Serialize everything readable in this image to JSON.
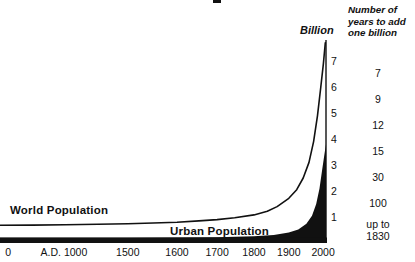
{
  "figure": {
    "background": "#ffffff",
    "ink_color": "#111111",
    "right_header_lines": [
      "Number of",
      "years to add",
      "one billion"
    ]
  },
  "chart_data": {
    "type": "area",
    "title": "",
    "y_axis_title": "Billion",
    "ylim": [
      0,
      7.8
    ],
    "y_tick_labels": [
      "1",
      "2",
      "3",
      "4",
      "5",
      "6",
      "7"
    ],
    "x_tick_labels": [
      "0",
      "A.D. 1000",
      "1500",
      "1600",
      "1700",
      "1800",
      "1900",
      "2000"
    ],
    "x_tick_positions": [
      0.025,
      0.196,
      0.392,
      0.543,
      0.666,
      0.779,
      0.886,
      0.991
    ],
    "x_axis_note": "non-linear year scale",
    "legend_position": "labels on chart",
    "grid": false,
    "series": [
      {
        "name": "World Population",
        "type": "line",
        "unit": "billions",
        "points": [
          [
            0.0,
            0.68
          ],
          [
            0.1,
            0.69
          ],
          [
            0.2,
            0.7
          ],
          [
            0.3,
            0.72
          ],
          [
            0.392,
            0.74
          ],
          [
            0.47,
            0.77
          ],
          [
            0.543,
            0.8
          ],
          [
            0.61,
            0.85
          ],
          [
            0.666,
            0.9
          ],
          [
            0.72,
            0.97
          ],
          [
            0.779,
            1.08
          ],
          [
            0.82,
            1.22
          ],
          [
            0.85,
            1.4
          ],
          [
            0.886,
            1.72
          ],
          [
            0.91,
            2.05
          ],
          [
            0.93,
            2.5
          ],
          [
            0.948,
            3.1
          ],
          [
            0.962,
            3.9
          ],
          [
            0.974,
            4.9
          ],
          [
            0.984,
            6.0
          ],
          [
            0.992,
            6.9
          ],
          [
            0.998,
            7.7
          ]
        ]
      },
      {
        "name": "Urban Population",
        "type": "filled_area",
        "unit": "billions",
        "points": [
          [
            0.0,
            0.2
          ],
          [
            0.2,
            0.2
          ],
          [
            0.392,
            0.2
          ],
          [
            0.543,
            0.21
          ],
          [
            0.666,
            0.22
          ],
          [
            0.779,
            0.26
          ],
          [
            0.84,
            0.31
          ],
          [
            0.886,
            0.4
          ],
          [
            0.915,
            0.52
          ],
          [
            0.94,
            0.74
          ],
          [
            0.957,
            1.05
          ],
          [
            0.97,
            1.5
          ],
          [
            0.98,
            2.1
          ],
          [
            0.988,
            2.8
          ],
          [
            0.995,
            3.4
          ],
          [
            1.0,
            3.8
          ]
        ]
      }
    ],
    "right_column": {
      "header": "Number of years to add one billion",
      "entries": [
        {
          "gap": [
            6,
            7
          ],
          "label": "7"
        },
        {
          "gap": [
            5,
            6
          ],
          "label": "9"
        },
        {
          "gap": [
            4,
            5
          ],
          "label": "12"
        },
        {
          "gap": [
            3,
            4
          ],
          "label": "15"
        },
        {
          "gap": [
            2,
            3
          ],
          "label": "30"
        },
        {
          "gap": [
            1,
            2
          ],
          "label": "100"
        },
        {
          "gap": [
            0,
            1
          ],
          "label": "up to 1830"
        }
      ]
    }
  }
}
